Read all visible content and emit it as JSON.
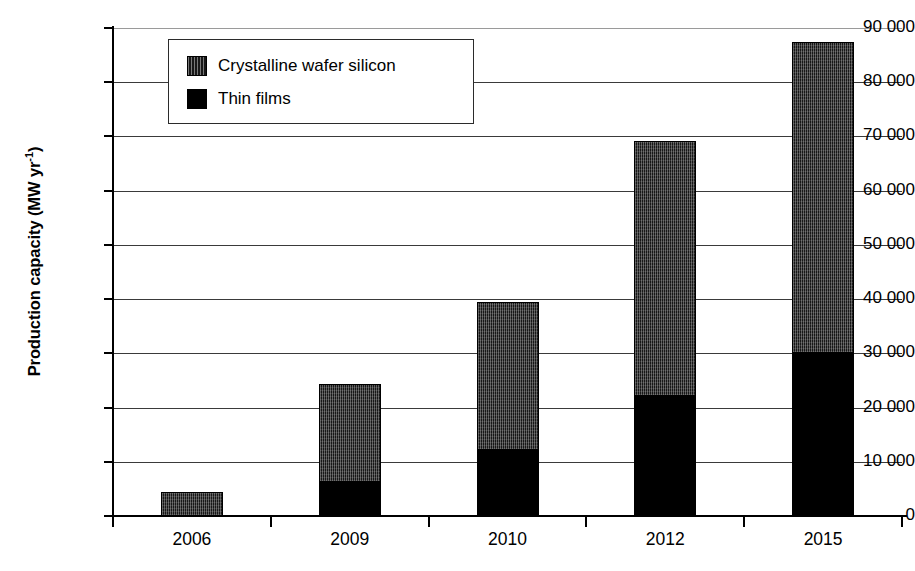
{
  "chart_data": {
    "type": "bar",
    "stacked": true,
    "title": "",
    "subtitle": "",
    "xlabel": "",
    "ylabel": "Production capacity (MW yr-1)",
    "ylabel_parts": {
      "base": "Production capacity (MW yr",
      "exponent": "-1",
      "suffix": ")"
    },
    "categories": [
      "2006",
      "2009",
      "2010",
      "2012",
      "2015"
    ],
    "series": [
      {
        "name": "Thin films",
        "color": "#000000",
        "values": [
          0,
          6300,
          12200,
          22200,
          30000
        ]
      },
      {
        "name": "Crystalline wafer silicon",
        "color": "#171717",
        "values": [
          4500,
          18100,
          27300,
          47000,
          57500
        ]
      }
    ],
    "totals": [
      4500,
      24400,
      39500,
      69200,
      87500
    ],
    "ylim": [
      0,
      90000
    ],
    "ytick_values": [
      0,
      10000,
      20000,
      30000,
      40000,
      50000,
      60000,
      70000,
      80000,
      90000
    ],
    "ytick_labels": [
      "0",
      "10 000",
      "20 000",
      "30 000",
      "40 000",
      "50 000",
      "60 000",
      "70 000",
      "80 000",
      "90 000"
    ],
    "grid": true,
    "grid_axis": "y",
    "legend_position": "top-left-inside",
    "legend_entries": [
      {
        "label": "Crystalline wafer silicon",
        "swatch": "crystal"
      },
      {
        "label": "Thin films",
        "swatch": "thin"
      }
    ]
  }
}
